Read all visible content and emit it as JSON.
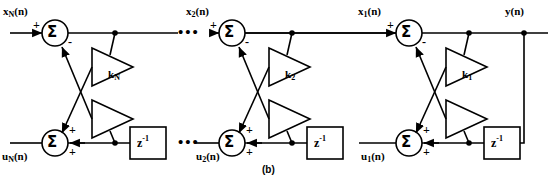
{
  "figure": {
    "caption": "(b)",
    "type": "lattice-filter-signal-flow-graph",
    "stroke_color": "#000000",
    "background_color": "#ffffff"
  },
  "top_row": {
    "inputs": [
      {
        "label_base": "x",
        "label_sub": "N",
        "label_tail": "(n)",
        "sign": "+"
      },
      {
        "label_base": "x",
        "label_sub": "2",
        "label_tail": "(n)",
        "sign": "+"
      },
      {
        "label_base": "x",
        "label_sub": "1",
        "label_tail": "(n)",
        "sign": "+"
      }
    ],
    "output": {
      "label_base": "y",
      "label_sub": "",
      "label_tail": "(n)"
    },
    "adder_glyph": "Σ",
    "feedback_sign": "-",
    "ellipsis": "•••"
  },
  "bottom_row": {
    "signals": [
      {
        "label_base": "u",
        "label_sub": "N",
        "label_tail": "(n)"
      },
      {
        "label_base": "u",
        "label_sub": "2",
        "label_tail": "(n)"
      },
      {
        "label_base": "u",
        "label_sub": "1",
        "label_tail": "(n)"
      }
    ],
    "adder_glyph": "Σ",
    "signs": [
      "+",
      "+"
    ],
    "delay_label_base": "z",
    "delay_label_exponent": "-1",
    "ellipsis": "•••"
  },
  "gains": [
    {
      "label_base": "k",
      "label_sub": "N"
    },
    {
      "label_base": "k",
      "label_sub": "2"
    },
    {
      "label_base": "k",
      "label_sub": "1"
    }
  ],
  "stages": [
    {
      "name": "stage-N",
      "top_adder_cx": 55,
      "top_adder_cy": 33,
      "bottom_adder_cx": 55,
      "bottom_adder_cy": 143,
      "tap_top_x": 115,
      "tap_bottom_x": 115,
      "delay_x": 130,
      "delay_y": 127,
      "gain_label_x": 108,
      "gain_label_y": 77
    },
    {
      "name": "stage-2",
      "top_adder_cx": 232,
      "top_adder_cy": 33,
      "bottom_adder_cx": 232,
      "bottom_adder_cy": 143,
      "tap_top_x": 292,
      "tap_bottom_x": 292,
      "delay_x": 307,
      "delay_y": 127,
      "gain_label_x": 285,
      "gain_label_y": 77
    },
    {
      "name": "stage-1",
      "top_adder_cx": 409,
      "top_adder_cy": 33,
      "bottom_adder_cx": 409,
      "bottom_adder_cy": 143,
      "tap_top_x": 469,
      "tap_bottom_x": 469,
      "delay_x": 484,
      "delay_y": 127,
      "gain_label_x": 462,
      "gain_label_y": 77
    }
  ],
  "output_node": {
    "x": 524,
    "y": 33
  }
}
